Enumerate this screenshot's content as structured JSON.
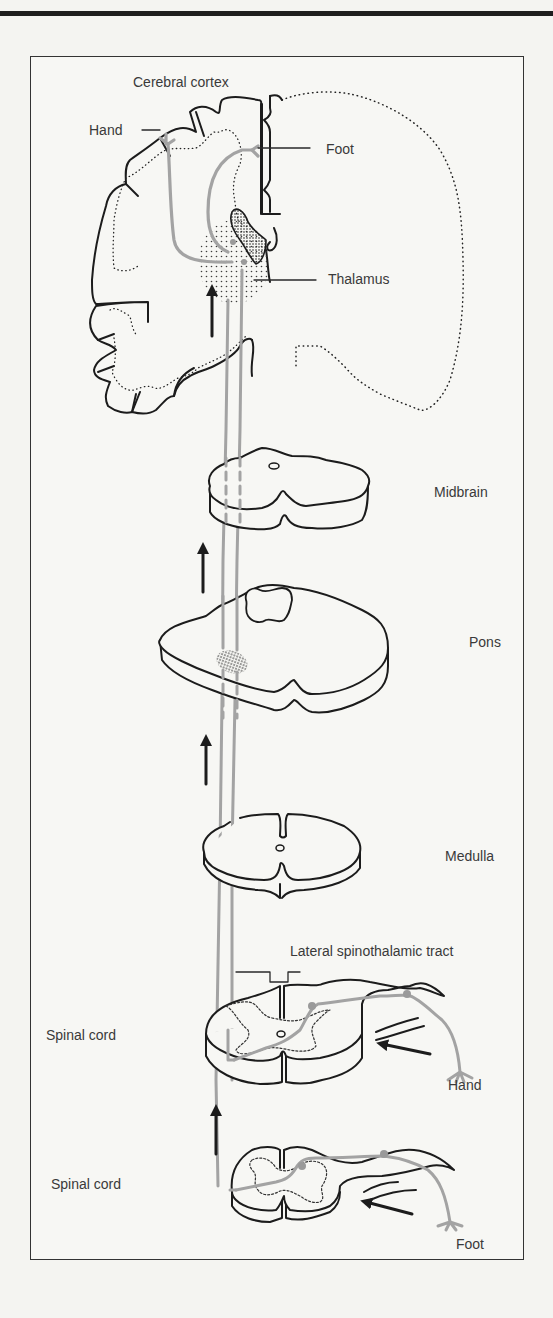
{
  "figure": {
    "type": "neuroanatomy-pathway-diagram"
  },
  "labels": {
    "cerebral_cortex": "Cerebral cortex",
    "hand_cortex": "Hand",
    "foot_cortex": "Foot",
    "thalamus": "Thalamus",
    "midbrain": "Midbrain",
    "pons": "Pons",
    "medulla": "Medulla",
    "tract": "Lateral spinothalamic tract",
    "spinal_cord_upper": "Spinal cord",
    "hand_periphery": "Hand",
    "spinal_cord_lower": "Spinal cord",
    "foot_periphery": "Foot"
  },
  "levels": [
    {
      "name": "Cerebral cortex",
      "order": 1
    },
    {
      "name": "Thalamus",
      "order": 2
    },
    {
      "name": "Midbrain",
      "order": 3
    },
    {
      "name": "Pons",
      "order": 4
    },
    {
      "name": "Medulla",
      "order": 5
    },
    {
      "name": "Spinal cord (cervical, hand input)",
      "order": 6
    },
    {
      "name": "Spinal cord (lumbar, foot input)",
      "order": 7
    }
  ],
  "colors": {
    "ink": "#1c1c1c",
    "pathway_gray": "#a3a3a3",
    "label": "#3a3a3a",
    "paper": "#f7f7f4"
  }
}
